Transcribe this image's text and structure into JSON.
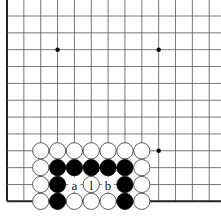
{
  "board": {
    "grid": {
      "x0": 7,
      "y0": 16,
      "spacing": 16.85,
      "cols": 13,
      "rows": 12,
      "left_edge": true,
      "bottom_edge": true
    },
    "hoshi": [
      {
        "col": 3,
        "row": 2
      },
      {
        "col": 9,
        "row": 2
      },
      {
        "col": 9,
        "row": 8
      }
    ],
    "stones": [
      {
        "col": 2,
        "row": 8,
        "color": "white"
      },
      {
        "col": 3,
        "row": 8,
        "color": "white"
      },
      {
        "col": 4,
        "row": 8,
        "color": "white"
      },
      {
        "col": 5,
        "row": 8,
        "color": "white"
      },
      {
        "col": 6,
        "row": 8,
        "color": "white"
      },
      {
        "col": 7,
        "row": 8,
        "color": "white"
      },
      {
        "col": 8,
        "row": 8,
        "color": "white"
      },
      {
        "col": 2,
        "row": 9,
        "color": "white"
      },
      {
        "col": 3,
        "row": 9,
        "color": "black"
      },
      {
        "col": 4,
        "row": 9,
        "color": "black"
      },
      {
        "col": 5,
        "row": 9,
        "color": "black"
      },
      {
        "col": 6,
        "row": 9,
        "color": "black"
      },
      {
        "col": 7,
        "row": 9,
        "color": "black"
      },
      {
        "col": 8,
        "row": 9,
        "color": "white"
      },
      {
        "col": 2,
        "row": 10,
        "color": "white"
      },
      {
        "col": 3,
        "row": 10,
        "color": "black"
      },
      {
        "col": 5,
        "row": 10,
        "color": "white",
        "label": "l"
      },
      {
        "col": 7,
        "row": 10,
        "color": "black"
      },
      {
        "col": 8,
        "row": 10,
        "color": "white"
      },
      {
        "col": 2,
        "row": 11,
        "color": "white"
      },
      {
        "col": 3,
        "row": 11,
        "color": "black"
      },
      {
        "col": 4,
        "row": 11,
        "color": "white"
      },
      {
        "col": 5,
        "row": 11,
        "color": "white"
      },
      {
        "col": 6,
        "row": 11,
        "color": "white"
      },
      {
        "col": 7,
        "row": 11,
        "color": "black"
      },
      {
        "col": 8,
        "row": 11,
        "color": "white"
      }
    ],
    "labels": [
      {
        "col": 4,
        "row": 10,
        "text": "a"
      },
      {
        "col": 6,
        "row": 10,
        "text": "b"
      }
    ]
  }
}
